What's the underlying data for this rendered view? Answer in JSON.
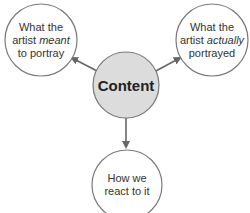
{
  "diagram": {
    "center": {
      "label": "Content",
      "fill": "#dcdcdc"
    },
    "nodes": [
      {
        "id": "meant",
        "line1": "What the",
        "line2_pre": "artist ",
        "line2_em": "meant",
        "line3": "to portray"
      },
      {
        "id": "actually",
        "line1": "What the",
        "line2_pre": "artist ",
        "line2_em": "actually",
        "line3": "portrayed"
      },
      {
        "id": "react",
        "line1": "How we",
        "line2": "react to it"
      }
    ],
    "colors": {
      "stroke": "#7a7a7a",
      "arrow": "#666666",
      "node_fill": "#ffffff"
    }
  }
}
